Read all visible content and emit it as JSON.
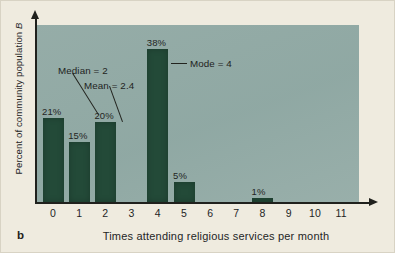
{
  "figure": {
    "panel_label": "b",
    "background_color": "#efebdf",
    "plot_background_color": "#93aaa6",
    "bar_color": "#234a38"
  },
  "chart_data": {
    "type": "bar",
    "title": "",
    "subtitle": "",
    "xlabel": "Times attending religious services per month",
    "ylabel": "Percent of community population B",
    "categories": [
      "0",
      "1",
      "2",
      "3",
      "4",
      "5",
      "6",
      "7",
      "8",
      "9",
      "10",
      "11"
    ],
    "values": [
      21,
      15,
      20,
      0,
      38,
      5,
      0,
      0,
      1,
      0,
      0,
      0
    ],
    "value_labels": [
      "21%",
      "15%",
      "20%",
      "",
      "38%",
      "5%",
      "",
      "",
      "1%",
      "",
      "",
      ""
    ],
    "ylim": [
      0,
      44
    ],
    "xlim": [
      -0.6,
      11.6
    ],
    "grid": false,
    "legend": null,
    "annotations": [
      {
        "text": "Median = 2",
        "points_to_category": "2"
      },
      {
        "text": "Mean = 2.4",
        "points_to_category": "2"
      },
      {
        "text": "Mode = 4",
        "points_to_category": "4"
      }
    ],
    "statistics": {
      "median": 2,
      "mean": 2.4,
      "mode": 4
    }
  }
}
